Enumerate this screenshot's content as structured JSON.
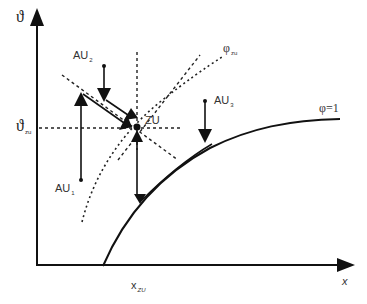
{
  "diagram": {
    "axes": {
      "y_label": "ϑ",
      "x_label": "x",
      "y_tick": {
        "symbol": "ϑ",
        "sub": "zu"
      },
      "x_tick": {
        "symbol": "x",
        "sub": "ZU"
      }
    },
    "curves": {
      "phi_zu": {
        "symbol": "φ",
        "sub": "zu"
      },
      "phi_one": {
        "label": "φ=1"
      }
    },
    "points": {
      "zu": {
        "label": "ZU"
      },
      "au1": {
        "symbol": "AU",
        "sub": "1"
      },
      "au2": {
        "symbol": "AU",
        "sub": "2"
      },
      "au3": {
        "symbol": "AU",
        "sub": "3"
      }
    },
    "colors": {
      "line": "#111111",
      "text": "#333333",
      "background": "#ffffff"
    }
  }
}
